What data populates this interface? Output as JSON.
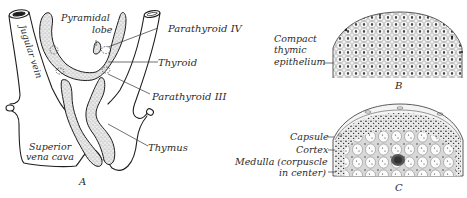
{
  "figure": {
    "panels": [
      {
        "id": "A",
        "label": "A",
        "description": "Gross anatomy of thyroid, parathyroids and thymus",
        "labels": {
          "pyramidal_lobe_1": "Pyramidal",
          "pyramidal_lobe_2": "lobe",
          "jugular_vein": "Jugular vein",
          "parathyroid_iv": "Parathyroid IV",
          "thyroid": "Thyroid",
          "parathyroid_iii": "Parathyroid III",
          "superior_vena_cava_1": "Superior",
          "superior_vena_cava_2": "vena cava",
          "thymus": "Thymus"
        }
      },
      {
        "id": "B",
        "label": "B",
        "description": "Early thymus section",
        "labels": {
          "compact_1": "Compact",
          "compact_2": "thymic",
          "compact_3": "epithelium"
        }
      },
      {
        "id": "C",
        "label": "C",
        "description": "Later thymus section",
        "labels": {
          "capsule": "Capsule",
          "cortex": "Cortex",
          "medulla_1": "Medulla (corpuscle",
          "medulla_2": "in center)"
        }
      }
    ],
    "colors": {
      "ink": "#2a2a2a",
      "stipple": "#555555",
      "background": "#ffffff"
    }
  }
}
